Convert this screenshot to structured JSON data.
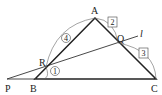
{
  "diagram": {
    "title": "",
    "points": {
      "A": {
        "label": "A",
        "x": 95,
        "y": 18
      },
      "B": {
        "label": "B",
        "x": 35,
        "y": 79
      },
      "C": {
        "label": "C",
        "x": 156,
        "y": 79
      },
      "P": {
        "label": "P",
        "x": 7,
        "y": 79
      },
      "Q": {
        "label": "Q",
        "x": 118,
        "y": 43
      },
      "R": {
        "label": "R",
        "x": 46,
        "y": 67
      }
    },
    "line_label": "l",
    "ratios": {
      "AR": "4",
      "RB": "1",
      "AQ": "2",
      "QC": "3"
    },
    "colors": {
      "stroke": "#222222",
      "thin": "#555555"
    }
  }
}
